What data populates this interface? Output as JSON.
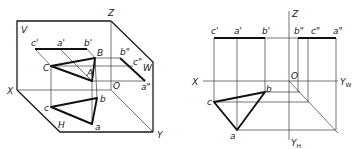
{
  "left_figure": {
    "description": "Isometric three-projection-plane view of triangle ABC",
    "plane_labels": {
      "V": "V",
      "H": "H",
      "W": "W"
    },
    "axis_labels": {
      "X": "X",
      "Y": "Y",
      "Z": "Z",
      "O": "O"
    },
    "space_points": {
      "A": "A",
      "B": "B",
      "C": "C"
    },
    "front_projections": {
      "a": "a'",
      "b": "b'",
      "c": "c'"
    },
    "top_projections": {
      "a": "a",
      "b": "b",
      "c": "c"
    },
    "side_projections": {
      "a": "a\"",
      "b": "b\"",
      "c": "c\""
    }
  },
  "right_figure": {
    "description": "Orthographic three-view projection of triangle abc",
    "axis_labels": {
      "X": "X",
      "Z": "Z",
      "O": "O",
      "YW": "Y",
      "YW_sub": "W",
      "YH": "Y",
      "YH_sub": "H"
    },
    "front_projections": {
      "a": "a'",
      "b": "b'",
      "c": "c'"
    },
    "top_projections": {
      "a": "a",
      "b": "b",
      "c": "c"
    },
    "side_projections": {
      "a": "a\"",
      "b": "b\"",
      "c": "c\""
    }
  }
}
